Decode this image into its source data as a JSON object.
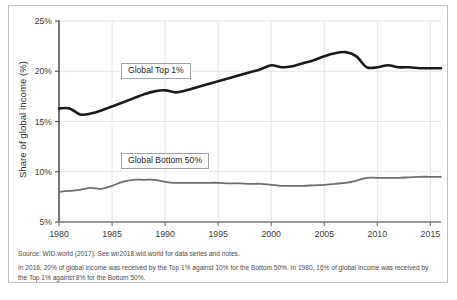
{
  "chart_data": {
    "type": "line",
    "title": "",
    "xlabel": "",
    "ylabel": "Share of global income (%)",
    "xlim": [
      1980,
      2016
    ],
    "ylim": [
      5,
      25
    ],
    "yticks": [
      "5%",
      "10%",
      "15%",
      "20%",
      "25%"
    ],
    "ytick_values": [
      5,
      10,
      15,
      20,
      25
    ],
    "xticks": [
      "1980",
      "1985",
      "1990",
      "1995",
      "2000",
      "2005",
      "2010",
      "2015"
    ],
    "xtick_values": [
      1980,
      1985,
      1990,
      1995,
      2000,
      2005,
      2010,
      2015
    ],
    "grid": true,
    "legend_position": "inside-plot",
    "x": [
      1980,
      1981,
      1982,
      1983,
      1984,
      1985,
      1986,
      1987,
      1988,
      1989,
      1990,
      1991,
      1992,
      1993,
      1994,
      1995,
      1996,
      1997,
      1998,
      1999,
      2000,
      2001,
      2002,
      2003,
      2004,
      2005,
      2006,
      2007,
      2008,
      2009,
      2010,
      2011,
      2012,
      2013,
      2014,
      2015,
      2016
    ],
    "series": [
      {
        "name": "Global Top 1%",
        "color": "#1a1a1a",
        "values": [
          16.3,
          16.3,
          15.7,
          15.8,
          16.1,
          16.5,
          16.9,
          17.3,
          17.7,
          18.0,
          18.1,
          17.9,
          18.1,
          18.4,
          18.7,
          19.0,
          19.3,
          19.6,
          19.9,
          20.2,
          20.6,
          20.4,
          20.5,
          20.8,
          21.1,
          21.5,
          21.8,
          21.9,
          21.5,
          20.4,
          20.4,
          20.6,
          20.4,
          20.4,
          20.3,
          20.3,
          20.3
        ]
      },
      {
        "name": "Global Bottom 50%",
        "color": "#6e6e6e",
        "values": [
          8.0,
          8.1,
          8.2,
          8.4,
          8.3,
          8.6,
          9.0,
          9.2,
          9.2,
          9.2,
          9.0,
          8.9,
          8.9,
          8.9,
          8.9,
          8.9,
          8.85,
          8.85,
          8.8,
          8.8,
          8.7,
          8.6,
          8.6,
          8.6,
          8.65,
          8.7,
          8.8,
          8.9,
          9.1,
          9.4,
          9.4,
          9.4,
          9.4,
          9.45,
          9.5,
          9.5,
          9.5
        ]
      }
    ],
    "legend_labels": [
      "Global Top 1%",
      "Global Bottom 50%"
    ]
  },
  "legend": {
    "top_label": "Global Top 1%",
    "bottom_label": "Global Bottom 50%"
  },
  "axis": {
    "y_title": "Share of global income (%)"
  },
  "notes": {
    "source": "Source: WID.world (2017). See wir2018.wid.world for data series and notes.",
    "explanation": "In 2016, 20% of global income was received by the Top 1% against 10% for the Bottom 50%. In 1980, 16% of global income was received by the Top 1% against 8% for the Bottom 50%."
  },
  "caption": {
    "text": ""
  },
  "colors": {
    "top_series": "#1a1a1a",
    "bottom_series": "#6e6e6e",
    "grid": "#e3e6e8",
    "axis": "#555555",
    "frame": "#b9c0c6"
  }
}
